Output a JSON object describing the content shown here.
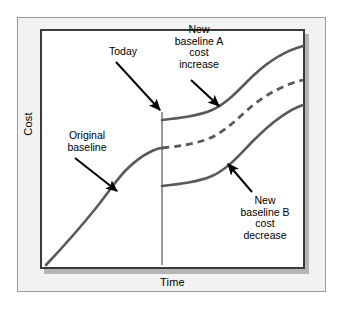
{
  "figure": {
    "type": "line-diagram",
    "title_present": false,
    "axes": {
      "y_label": "Cost",
      "x_label": "Time",
      "ticks": "none",
      "grid": "off"
    },
    "colors": {
      "curve": "#595959",
      "frame": "#3a3a3a",
      "panel_bg": "#f2f2f2",
      "plot_bg": "#ffffff",
      "shadow": "#b5b5b5",
      "text": "#000000",
      "today_line": "#6e6e6e"
    },
    "annotations": {
      "today": "Today",
      "baseline_a": "New\nbaseline A\ncost\nincrease",
      "original": "Original\nbaseline",
      "baseline_b": "New\nbaseline B\ncost\ndecrease"
    },
    "series": [
      {
        "name": "Original baseline",
        "style": "solid",
        "segment": "past",
        "points": "M46,265 C62,248 80,228 96,208 C110,190 118,178 126,170 C134,162 142,156 150,152 C156,149 159,148 162,148"
      },
      {
        "name": "Original baseline projection",
        "style": "dashed",
        "segment": "future",
        "points": "M162,148 C180,146 196,144 210,138 C226,131 238,118 252,106 C268,93 286,84 303,80"
      },
      {
        "name": "New baseline A cost increase",
        "style": "solid",
        "segment": "future",
        "points": "M162,120 C180,118 198,116 212,110 C228,103 240,88 254,75 C270,60 288,50 303,46"
      },
      {
        "name": "New baseline B cost decrease",
        "style": "solid",
        "segment": "future",
        "points": "M162,186 C180,184 198,182 212,176 C228,169 240,154 254,140 C270,124 288,110 303,105"
      }
    ],
    "today_marker": {
      "label": "Today",
      "x": 162,
      "y_top": 112,
      "y_bottom": 265
    },
    "arrows": [
      {
        "name": "today-arrow",
        "from": [
          116,
          62
        ],
        "to": [
          160,
          110
        ]
      },
      {
        "name": "baseline-a-arrow",
        "from": [
          191,
          80
        ],
        "to": [
          219,
          106
        ]
      },
      {
        "name": "original-arrow",
        "from": [
          75,
          158
        ],
        "to": [
          117,
          191
        ]
      },
      {
        "name": "baseline-b-arrow",
        "from": [
          252,
          192
        ],
        "to": [
          228,
          164
        ]
      }
    ]
  }
}
